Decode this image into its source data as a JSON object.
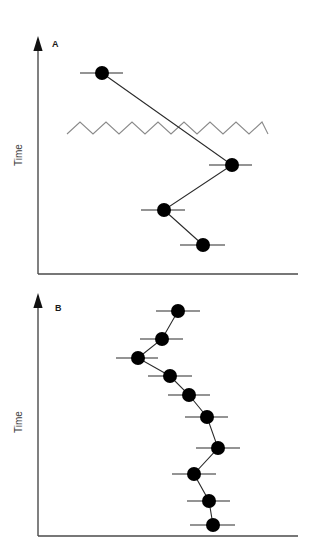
{
  "figure": {
    "background_color": "#ffffff",
    "width": 313,
    "height": 546,
    "marker_color": "#000000",
    "line_color": "#2b2b2b",
    "axis_color": "#4a4a4a",
    "zigzag_color": "#8a8a8a"
  },
  "panels": [
    {
      "id": "A",
      "label": "A",
      "label_x": 52,
      "label_y": 47,
      "y_axis_title": "Time",
      "y_axis_title_x": 22,
      "y_axis_title_y": 155,
      "axis": {
        "x_start": 38,
        "x_end": 298,
        "y_baseline": 274,
        "y_top": 38,
        "arrow_tip_y": 36
      },
      "zigzag": {
        "x_start": 67,
        "x_end": 268,
        "y_center": 128,
        "amplitude": 6,
        "half_period": 13
      },
      "points": [
        {
          "x": 102,
          "y": 73,
          "err_low": 80,
          "err_high": 123,
          "r": 7
        },
        {
          "x": 232,
          "y": 165,
          "err_low": 209,
          "err_high": 252,
          "r": 7
        },
        {
          "x": 164,
          "y": 210,
          "err_low": 141,
          "err_high": 185,
          "r": 7
        },
        {
          "x": 203,
          "y": 245,
          "err_low": 180,
          "err_high": 225,
          "r": 7
        }
      ]
    },
    {
      "id": "B",
      "label": "B",
      "label_x": 55,
      "label_y": 311,
      "y_axis_title": "Time",
      "y_axis_title_x": 22,
      "y_axis_title_y": 422,
      "axis": {
        "x_start": 38,
        "x_end": 298,
        "y_baseline": 536,
        "y_top": 296,
        "arrow_tip_y": 293
      },
      "points": [
        {
          "x": 178,
          "y": 311,
          "err_low": 156,
          "err_high": 200,
          "r": 7
        },
        {
          "x": 162,
          "y": 339,
          "err_low": 140,
          "err_high": 183,
          "r": 7
        },
        {
          "x": 138,
          "y": 358,
          "err_low": 116,
          "err_high": 158,
          "r": 7
        },
        {
          "x": 170,
          "y": 376,
          "err_low": 148,
          "err_high": 192,
          "r": 7
        },
        {
          "x": 189,
          "y": 395,
          "err_low": 168,
          "err_high": 210,
          "r": 7
        },
        {
          "x": 207,
          "y": 417,
          "err_low": 185,
          "err_high": 228,
          "r": 7
        },
        {
          "x": 218,
          "y": 448,
          "err_low": 196,
          "err_high": 240,
          "r": 7
        },
        {
          "x": 194,
          "y": 474,
          "err_low": 172,
          "err_high": 216,
          "r": 7
        },
        {
          "x": 209,
          "y": 501,
          "err_low": 187,
          "err_high": 230,
          "r": 7
        },
        {
          "x": 213,
          "y": 525,
          "err_low": 190,
          "err_high": 235,
          "r": 7
        }
      ]
    }
  ],
  "chart_data": {
    "type": "scatter",
    "title": "",
    "subtitle": "",
    "xlabel": "",
    "ylabel": "Time",
    "grid": false,
    "legend_position": "none",
    "orientation": "value-on-x, time-on-y (time increasing downward)",
    "annotations": [
      "A",
      "B",
      "zigzag break line in panel A"
    ],
    "panels": [
      {
        "panel": "A",
        "type": "scatter",
        "ylabel": "Time",
        "xlabel": "",
        "n_points": 4,
        "series": [
          {
            "name": "Panel A series",
            "x": [
              102,
              232,
              164,
              203
            ],
            "y_index": [
              1,
              2,
              3,
              4
            ],
            "x_err_low": [
              80,
              209,
              141,
              180
            ],
            "x_err_high": [
              123,
              252,
              185,
              225
            ],
            "connected": true
          }
        ]
      },
      {
        "panel": "B",
        "type": "scatter",
        "ylabel": "Time",
        "xlabel": "",
        "n_points": 10,
        "series": [
          {
            "name": "Panel B series",
            "x": [
              178,
              162,
              138,
              170,
              189,
              207,
              218,
              194,
              209,
              213
            ],
            "y_index": [
              1,
              2,
              3,
              4,
              5,
              6,
              7,
              8,
              9,
              10
            ],
            "x_err_low": [
              156,
              140,
              116,
              148,
              168,
              185,
              196,
              172,
              187,
              190
            ],
            "x_err_high": [
              200,
              183,
              158,
              192,
              210,
              228,
              240,
              216,
              230,
              235
            ],
            "connected": true
          }
        ]
      }
    ]
  }
}
